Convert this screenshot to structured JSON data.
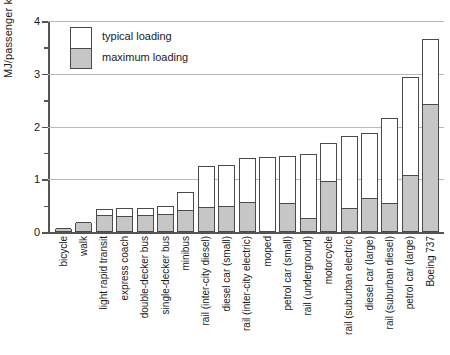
{
  "chart_data": {
    "type": "bar",
    "title": "",
    "xlabel": "",
    "ylabel": "MJ/passenger km",
    "ylim": [
      0,
      4
    ],
    "yticks_major": [
      0,
      1,
      2,
      3,
      4
    ],
    "yticks_major_labels": [
      "0",
      "1",
      "2",
      "3",
      "4"
    ],
    "yticks_minor": [
      0.5,
      1.5,
      2.5,
      3.5
    ],
    "grid": "horizontal gridlines at 1, 2, 3, 4",
    "legend_position": "top-left inside axes",
    "legend": [
      {
        "key": "typical",
        "label": "typical loading",
        "color": "#ffffff"
      },
      {
        "key": "maximum",
        "label": "maximum loading",
        "color": "#c6c6c6"
      }
    ],
    "categories": [
      "bicycle",
      "walk",
      "light rapid transit",
      "express coach",
      "double-decker bus",
      "single-decker bus",
      "minibus",
      "rail (inter-city diesel)",
      "diesel car (small)",
      "rail (inter-city electric)",
      "moped",
      "petrol car (small)",
      "rail (underground)",
      "motorcycle",
      "rail (suburban electric)",
      "diesel car (large)",
      "rail (suburban diesel)",
      "petrol car (large)",
      "Boeing 737"
    ],
    "series": [
      {
        "name": "typical loading",
        "values": [
          0.06,
          0.17,
          0.43,
          0.45,
          0.45,
          0.5,
          0.75,
          1.25,
          1.27,
          1.4,
          1.42,
          1.45,
          1.47,
          1.68,
          1.82,
          1.87,
          2.17,
          2.93,
          3.65
        ]
      },
      {
        "name": "maximum loading",
        "values": [
          0.06,
          0.17,
          0.3,
          0.29,
          0.3,
          0.33,
          0.4,
          0.45,
          0.47,
          0.55,
          0.0,
          0.53,
          0.25,
          0.95,
          0.44,
          0.63,
          0.53,
          1.07,
          2.4
        ]
      }
    ]
  }
}
